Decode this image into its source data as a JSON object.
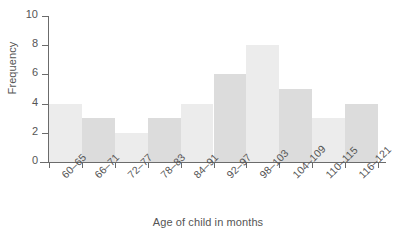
{
  "chart_data": {
    "type": "bar",
    "title": "",
    "xlabel": "Age of child in months",
    "ylabel": "Frequency",
    "categories": [
      "60–65",
      "66–71",
      "72–77",
      "78–83",
      "84–91",
      "92–97",
      "98–103",
      "104–109",
      "110–115",
      "116–121"
    ],
    "values": [
      4,
      3,
      2,
      3,
      4,
      6,
      8,
      5,
      3,
      4
    ],
    "ylim": [
      0,
      10
    ],
    "yticks": [
      0,
      2,
      4,
      6,
      8,
      10
    ],
    "ytick_labels": [
      "0",
      "2",
      "4",
      "6",
      "8",
      "10"
    ],
    "grid": false,
    "legend": "none",
    "bar_colors": [
      "#ececec",
      "#dcdcdc",
      "#ececec",
      "#dcdcdc",
      "#ececec",
      "#dcdcdc",
      "#ececec",
      "#dcdcdc",
      "#ececec",
      "#dcdcdc"
    ],
    "axis_color": "#6b6b6b",
    "text_color": "#555555",
    "background": "#ffffff"
  }
}
